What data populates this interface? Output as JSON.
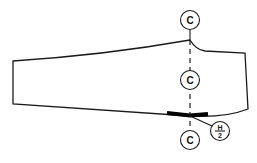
{
  "diagram": {
    "type": "pattern-piece",
    "labels": {
      "center_top": "C",
      "center_middle": "C",
      "center_bottom": "C",
      "half_measure_numerator": "H",
      "half_measure_denominator": "2"
    },
    "colors": {
      "line": "#1a1a1a",
      "marker_bar": "#000000",
      "background": "#ffffff"
    }
  }
}
